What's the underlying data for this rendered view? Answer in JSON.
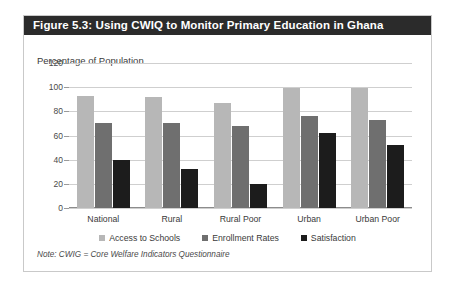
{
  "figure": {
    "title": "Figure 5.3: Using CWIQ to Monitor Primary Education in Ghana",
    "note": "Note: CWIG = Core Welfare Indicators Questionnaire"
  },
  "colors": {
    "title_bar": "#2b2b2b",
    "series_access": "#b7b7b7",
    "series_enrollment": "#6f6f6f",
    "series_satisfaction": "#1c1c1c",
    "gridline": "#cfcfcf",
    "frame_border": "#c9c9c9"
  },
  "chart_data": {
    "type": "bar",
    "title": "Percentage of Population",
    "subtitle": "Percentage of Population",
    "xlabel": "",
    "ylabel": "",
    "ylim": [
      0,
      120
    ],
    "yticks": [
      0,
      20,
      40,
      60,
      80,
      100,
      120
    ],
    "ytick_labels": [
      "0",
      "20",
      "40",
      "60",
      "80",
      "100",
      "120"
    ],
    "grid": true,
    "legend_position": "bottom",
    "categories": [
      "National",
      "Rural",
      "Rural Poor",
      "Urban",
      "Urban Poor"
    ],
    "series": [
      {
        "name": "Access to Schools",
        "color": "#b7b7b7",
        "values": [
          93,
          92,
          87,
          99,
          99
        ]
      },
      {
        "name": "Enrollment Rates",
        "color": "#6f6f6f",
        "values": [
          70,
          70,
          68,
          76,
          73
        ]
      },
      {
        "name": "Satisfaction",
        "color": "#1c1c1c",
        "values": [
          40,
          32,
          20,
          62,
          52
        ]
      }
    ]
  }
}
